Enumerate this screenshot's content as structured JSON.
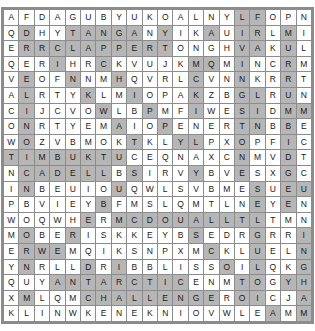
{
  "puzzle": {
    "type": "word-search-grid",
    "rows": 20,
    "cols": 20,
    "colors": {
      "cell_background": "#ffffff",
      "highlight_background": "#b6b6b6",
      "grid_line": "#8c8c8c",
      "letter_color": "#1a1a1a"
    },
    "grid": [
      [
        "A",
        "F",
        "D",
        "A",
        "G",
        "U",
        "B",
        "Y",
        "U",
        "K",
        "O",
        "A",
        "L",
        "N",
        "Y",
        "L",
        "F",
        "O",
        "P",
        "N"
      ],
      [
        "Q",
        "D",
        "H",
        "Y",
        "T",
        "A",
        "N",
        "G",
        "A",
        "N",
        "Y",
        "I",
        "K",
        "A",
        "U",
        "I",
        "R",
        "L",
        "M",
        "I"
      ],
      [
        "E",
        "R",
        "R",
        "C",
        "L",
        "A",
        "P",
        "P",
        "E",
        "R",
        "T",
        "O",
        "N",
        "G",
        "H",
        "V",
        "A",
        "K",
        "U",
        "L"
      ],
      [
        "Q",
        "E",
        "R",
        "I",
        "H",
        "R",
        "C",
        "K",
        "V",
        "U",
        "J",
        "K",
        "M",
        "Q",
        "M",
        "I",
        "N",
        "C",
        "R",
        "M"
      ],
      [
        "V",
        "E",
        "O",
        "F",
        "N",
        "N",
        "M",
        "H",
        "Q",
        "V",
        "R",
        "L",
        "C",
        "V",
        "N",
        "N",
        "K",
        "R",
        "R",
        "T"
      ],
      [
        "A",
        "L",
        "R",
        "T",
        "Y",
        "K",
        "L",
        "M",
        "I",
        "O",
        "P",
        "A",
        "K",
        "Z",
        "B",
        "G",
        "L",
        "R",
        "U",
        "N"
      ],
      [
        "C",
        "I",
        "J",
        "C",
        "V",
        "O",
        "W",
        "L",
        "B",
        "P",
        "M",
        "F",
        "I",
        "W",
        "E",
        "S",
        "I",
        "D",
        "M",
        "M"
      ],
      [
        "O",
        "N",
        "R",
        "T",
        "Y",
        "E",
        "M",
        "A",
        "I",
        "O",
        "P",
        "E",
        "N",
        "E",
        "R",
        "T",
        "N",
        "B",
        "B",
        "E"
      ],
      [
        "W",
        "O",
        "Z",
        "V",
        "B",
        "M",
        "O",
        "K",
        "T",
        "K",
        "L",
        "Y",
        "L",
        "P",
        "X",
        "O",
        "P",
        "F",
        "I",
        "C"
      ],
      [
        "T",
        "I",
        "M",
        "B",
        "U",
        "K",
        "T",
        "U",
        "C",
        "E",
        "Q",
        "N",
        "A",
        "X",
        "C",
        "N",
        "M",
        "V",
        "D",
        "T"
      ],
      [
        "N",
        "C",
        "A",
        "D",
        "E",
        "L",
        "L",
        "B",
        "S",
        "I",
        "R",
        "V",
        "Y",
        "B",
        "V",
        "E",
        "S",
        "X",
        "G",
        "C"
      ],
      [
        "I",
        "N",
        "B",
        "E",
        "U",
        "I",
        "O",
        "U",
        "Q",
        "W",
        "L",
        "S",
        "V",
        "B",
        "M",
        "E",
        "S",
        "U",
        "E",
        "U"
      ],
      [
        "P",
        "B",
        "V",
        "I",
        "E",
        "Y",
        "B",
        "F",
        "M",
        "S",
        "L",
        "Q",
        "M",
        "T",
        "L",
        "N",
        "E",
        "Y",
        "E",
        "N"
      ],
      [
        "W",
        "O",
        "Q",
        "W",
        "H",
        "E",
        "R",
        "M",
        "C",
        "D",
        "O",
        "U",
        "A",
        "L",
        "L",
        "T",
        "L",
        "T",
        "M",
        "N"
      ],
      [
        "M",
        "O",
        "B",
        "E",
        "R",
        "I",
        "S",
        "K",
        "K",
        "E",
        "Y",
        "B",
        "S",
        "E",
        "D",
        "R",
        "G",
        "R",
        "R",
        "I"
      ],
      [
        "E",
        "R",
        "W",
        "E",
        "M",
        "Q",
        "I",
        "K",
        "S",
        "N",
        "P",
        "X",
        "M",
        "C",
        "K",
        "L",
        "U",
        "E",
        "L",
        "N"
      ],
      [
        "Y",
        "N",
        "R",
        "L",
        "L",
        "D",
        "R",
        "I",
        "B",
        "B",
        "L",
        "I",
        "S",
        "S",
        "O",
        "I",
        "L",
        "Q",
        "K",
        "G"
      ],
      [
        "Q",
        "U",
        "Y",
        "A",
        "N",
        "T",
        "A",
        "R",
        "C",
        "T",
        "I",
        "C",
        "E",
        "N",
        "M",
        "T",
        "O",
        "G",
        "Y",
        "H"
      ],
      [
        "X",
        "M",
        "L",
        "Q",
        "M",
        "C",
        "H",
        "A",
        "L",
        "L",
        "E",
        "N",
        "G",
        "E",
        "R",
        "O",
        "I",
        "C",
        "J",
        "A"
      ],
      [
        "K",
        "L",
        "I",
        "N",
        "W",
        "K",
        "E",
        "N",
        "E",
        "K",
        "N",
        "I",
        "O",
        "V",
        "W",
        "L",
        "E",
        "A",
        "M",
        "M"
      ]
    ],
    "highlights": [
      [
        0,
        0,
        0,
        0,
        0,
        0,
        0,
        0,
        0,
        0,
        0,
        0,
        0,
        0,
        0,
        1,
        1,
        0,
        0,
        0
      ],
      [
        0,
        1,
        0,
        0,
        1,
        1,
        1,
        1,
        1,
        0,
        1,
        0,
        0,
        1,
        0,
        1,
        1,
        0,
        1,
        0
      ],
      [
        0,
        1,
        1,
        1,
        1,
        1,
        1,
        1,
        1,
        1,
        1,
        0,
        0,
        0,
        0,
        1,
        1,
        0,
        1,
        0
      ],
      [
        0,
        0,
        0,
        1,
        0,
        0,
        1,
        0,
        0,
        0,
        0,
        0,
        1,
        1,
        0,
        1,
        0,
        0,
        1,
        0
      ],
      [
        0,
        1,
        0,
        0,
        1,
        0,
        0,
        1,
        0,
        0,
        0,
        0,
        1,
        0,
        0,
        1,
        0,
        0,
        1,
        0
      ],
      [
        0,
        1,
        0,
        0,
        0,
        1,
        0,
        0,
        1,
        0,
        0,
        0,
        1,
        0,
        0,
        1,
        1,
        0,
        1,
        0
      ],
      [
        0,
        1,
        0,
        0,
        0,
        0,
        1,
        0,
        0,
        1,
        0,
        0,
        1,
        0,
        0,
        1,
        1,
        0,
        1,
        1
      ],
      [
        0,
        1,
        0,
        0,
        0,
        0,
        0,
        1,
        0,
        0,
        1,
        0,
        0,
        0,
        0,
        1,
        1,
        0,
        1,
        0
      ],
      [
        0,
        1,
        0,
        0,
        0,
        0,
        0,
        0,
        1,
        0,
        0,
        1,
        1,
        0,
        0,
        1,
        0,
        0,
        1,
        0
      ],
      [
        1,
        1,
        1,
        1,
        1,
        1,
        1,
        1,
        0,
        0,
        0,
        0,
        0,
        0,
        0,
        1,
        0,
        0,
        1,
        0
      ],
      [
        0,
        1,
        1,
        1,
        1,
        1,
        1,
        0,
        1,
        0,
        0,
        0,
        1,
        0,
        0,
        1,
        0,
        0,
        1,
        0
      ],
      [
        0,
        1,
        0,
        0,
        0,
        0,
        0,
        1,
        0,
        0,
        0,
        0,
        0,
        0,
        0,
        0,
        1,
        0,
        1,
        1
      ],
      [
        0,
        0,
        0,
        0,
        0,
        0,
        1,
        0,
        0,
        0,
        0,
        0,
        0,
        0,
        0,
        0,
        1,
        0,
        1,
        0
      ],
      [
        0,
        0,
        0,
        0,
        0,
        1,
        0,
        1,
        1,
        1,
        1,
        1,
        1,
        1,
        1,
        1,
        1,
        0,
        0,
        0
      ],
      [
        0,
        1,
        0,
        0,
        1,
        0,
        0,
        0,
        0,
        0,
        0,
        0,
        1,
        0,
        0,
        0,
        1,
        0,
        0,
        1
      ],
      [
        0,
        1,
        1,
        1,
        0,
        0,
        0,
        0,
        0,
        0,
        0,
        0,
        0,
        1,
        0,
        0,
        1,
        0,
        0,
        1
      ],
      [
        0,
        1,
        0,
        0,
        0,
        1,
        0,
        1,
        0,
        0,
        0,
        0,
        0,
        0,
        1,
        0,
        1,
        0,
        0,
        1
      ],
      [
        0,
        0,
        0,
        1,
        1,
        1,
        1,
        1,
        1,
        1,
        1,
        1,
        0,
        0,
        0,
        1,
        1,
        0,
        1,
        1
      ],
      [
        0,
        1,
        0,
        0,
        0,
        1,
        1,
        1,
        1,
        1,
        1,
        1,
        1,
        1,
        0,
        1,
        1,
        0,
        0,
        1
      ],
      [
        0,
        0,
        0,
        0,
        0,
        0,
        0,
        0,
        0,
        0,
        0,
        0,
        0,
        0,
        0,
        0,
        0,
        1,
        0,
        1
      ]
    ]
  }
}
